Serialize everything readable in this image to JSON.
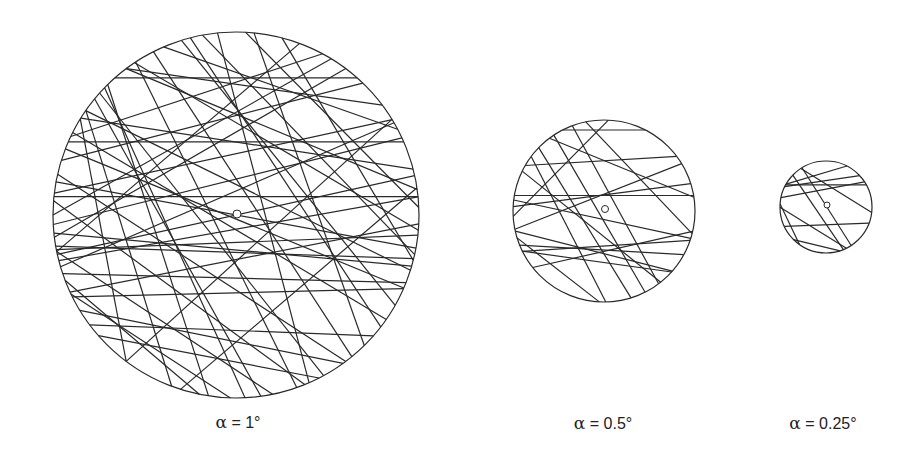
{
  "figure": {
    "background": "#ffffff",
    "stroke_color": "#2a2a2a",
    "panels": [
      {
        "id": "alpha-1",
        "label_symbol": "α",
        "label_rest": " = 1°",
        "label_x": 238,
        "label_y": 422,
        "circle": {
          "cx": 236,
          "cy": 215,
          "r": 183
        },
        "center_marker": {
          "cx": 237,
          "cy": 214,
          "r": 4
        },
        "chords": [
          [
            -1.2,
            -0.1,
            1.2,
            -0.1
          ],
          [
            -1.2,
            -0.4,
            1.2,
            -0.4
          ],
          [
            -0.31,
            -0.97,
            0.98,
            0.63
          ],
          [
            -0.77,
            -0.63,
            0.13,
            0.98
          ],
          [
            -0.95,
            0.4,
            -0.03,
            1.0
          ],
          [
            -1.0,
            0.45,
            1.0,
            0.4
          ],
          [
            -1.0,
            0.19,
            1.0,
            0.11
          ],
          [
            -1.0,
            0.17,
            1.0,
            0.24
          ],
          [
            -1.0,
            0.0,
            0.55,
            -0.87
          ],
          [
            -1.0,
            0.3,
            0.9,
            -0.52
          ],
          [
            -1.0,
            0.22,
            1.0,
            -0.22
          ],
          [
            -0.74,
            -0.66,
            0.52,
            0.93
          ],
          [
            -0.85,
            -0.53,
            0.97,
            -0.25
          ],
          [
            -0.6,
            -0.8,
            0.99,
            -0.14
          ],
          [
            -0.4,
            -0.92,
            0.88,
            -0.47
          ],
          [
            -0.66,
            -0.75,
            0.66,
            -0.75
          ],
          [
            -0.95,
            -0.3,
            0.69,
            -0.72
          ],
          [
            -0.99,
            -0.12,
            0.85,
            -0.52
          ],
          [
            -0.99,
            0.05,
            0.9,
            -0.42
          ],
          [
            -0.97,
            0.25,
            1.0,
            -0.1
          ],
          [
            -0.9,
            0.42,
            0.99,
            0.05
          ],
          [
            -1.0,
            -0.08,
            0.38,
            0.93
          ],
          [
            -0.98,
            0.2,
            0.2,
            0.98
          ],
          [
            -0.97,
            -0.22,
            0.6,
            0.8
          ],
          [
            -0.89,
            -0.45,
            0.82,
            0.57
          ],
          [
            -0.82,
            -0.57,
            0.95,
            0.3
          ],
          [
            -0.55,
            -0.83,
            0.99,
            0.08
          ],
          [
            -0.18,
            -0.98,
            0.98,
            0.22
          ],
          [
            0.05,
            -1.0,
            0.99,
            -0.05
          ],
          [
            0.35,
            -0.94,
            -0.98,
            0.2
          ],
          [
            0.6,
            -0.8,
            -0.99,
            0.12
          ],
          [
            0.47,
            -0.88,
            -0.9,
            -0.43
          ],
          [
            0.8,
            -0.6,
            -0.6,
            -0.8
          ],
          [
            -0.85,
            -0.52,
            -0.6,
            0.8
          ],
          [
            -0.82,
            -0.57,
            -0.35,
            0.94
          ],
          [
            -0.7,
            -0.71,
            -0.15,
            0.99
          ],
          [
            -0.72,
            -0.7,
            0.05,
            1.0
          ],
          [
            -0.55,
            -0.84,
            0.33,
            0.94
          ],
          [
            -0.45,
            -0.89,
            0.63,
            0.77
          ],
          [
            -0.25,
            -0.97,
            0.79,
            0.61
          ],
          [
            -0.95,
            0.32,
            0.93,
            0.37
          ],
          [
            -0.99,
            0.1,
            0.96,
            0.28
          ],
          [
            -0.8,
            0.6,
            0.75,
            0.66
          ],
          [
            -0.86,
            0.52,
            0.58,
            0.81
          ],
          [
            -0.98,
            -0.18,
            0.98,
            0.18
          ],
          [
            -0.93,
            -0.36,
            0.92,
            0.4
          ],
          [
            -0.6,
            0.8,
            0.85,
            -0.52
          ],
          [
            -0.3,
            0.95,
            0.99,
            -0.15
          ],
          [
            -0.93,
            0.36,
            -0.2,
            0.98
          ],
          [
            -0.75,
            0.66,
            0.45,
            0.89
          ],
          [
            0.1,
            -0.99,
            0.7,
            0.71
          ],
          [
            -0.1,
            -0.99,
            0.4,
            0.92
          ],
          [
            0.25,
            -0.97,
            0.97,
            0.25
          ]
        ]
      },
      {
        "id": "alpha-0.5",
        "label_symbol": "α",
        "label_rest": " = 0.5°",
        "label_x": 603,
        "label_y": 423,
        "circle": {
          "cx": 604,
          "cy": 211,
          "r": 91
        },
        "center_marker": {
          "cx": 605,
          "cy": 209,
          "r": 3.5
        },
        "chords": [
          [
            -1.2,
            -0.17,
            1.2,
            -0.17
          ],
          [
            -0.45,
            -0.89,
            0.45,
            -0.89
          ],
          [
            -0.72,
            -0.7,
            0.3,
            0.96
          ],
          [
            -0.8,
            -0.6,
            0.02,
            1.0
          ],
          [
            -0.9,
            -0.44,
            0.62,
            0.78
          ],
          [
            -0.6,
            -0.8,
            0.99,
            -0.15
          ],
          [
            -0.99,
            -0.12,
            0.95,
            0.3
          ],
          [
            -0.99,
            0.45,
            0.99,
            0.32
          ],
          [
            -1.0,
            0.37,
            0.88,
            0.48
          ],
          [
            -0.9,
            0.44,
            0.74,
            0.67
          ],
          [
            -0.98,
            0.2,
            0.85,
            -0.52
          ],
          [
            -0.87,
            -0.5,
            0.8,
            -0.6
          ],
          [
            -0.99,
            -0.05,
            0.95,
            -0.3
          ],
          [
            -0.78,
            0.62,
            0.99,
            0.22
          ],
          [
            -0.2,
            -0.98,
            0.97,
            0.25
          ],
          [
            -0.35,
            -0.94,
            0.6,
            0.8
          ],
          [
            0.05,
            -1.0,
            -0.99,
            0.05
          ],
          [
            -0.55,
            -0.83,
            0.45,
            0.89
          ],
          [
            -0.95,
            0.3,
            -0.05,
            1.0
          ],
          [
            -0.98,
            0.22,
            0.75,
            0.66
          ]
        ]
      },
      {
        "id": "alpha-0.25",
        "label_symbol": "α",
        "label_rest": " = 0.25°",
        "label_x": 823,
        "label_y": 423,
        "circle": {
          "cx": 826,
          "cy": 207,
          "r": 46
        },
        "center_marker": {
          "cx": 827,
          "cy": 205,
          "r": 3
        },
        "chords": [
          [
            -1.2,
            -0.48,
            1.2,
            -0.48
          ],
          [
            -0.52,
            -0.85,
            0.55,
            0.84
          ],
          [
            -0.72,
            -0.69,
            0.38,
            0.93
          ],
          [
            -0.55,
            -0.84,
            0.99,
            0.12
          ],
          [
            -0.99,
            -0.2,
            0.85,
            -0.55
          ],
          [
            -0.86,
            -0.5,
            0.45,
            -0.89
          ],
          [
            -0.9,
            -0.44,
            0.73,
            -0.68
          ],
          [
            -0.93,
            0.05,
            0.45,
            0.9
          ],
          [
            -0.9,
            0.42,
            0.99,
            0.35
          ],
          [
            -0.99,
            -0.05,
            -0.58,
            0.81
          ],
          [
            -0.7,
            0.71,
            0.3,
            0.95
          ]
        ]
      }
    ]
  }
}
